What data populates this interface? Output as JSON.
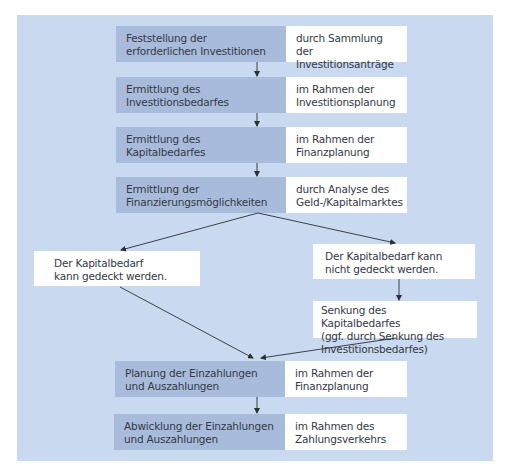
{
  "diagram": {
    "rows": [
      {
        "step": [
          "Feststellung der",
          "erforderlichen Investitionen"
        ],
        "note": [
          "durch Sammlung der",
          "Investitionsanträge"
        ]
      },
      {
        "step": [
          "Ermittlung des",
          "Investitionsbedarfes"
        ],
        "note": [
          "im Rahmen der",
          "Investitionsplanung"
        ]
      },
      {
        "step": [
          "Ermittlung des",
          "Kapitalbedarfes"
        ],
        "note": [
          "im Rahmen der",
          "Finanzplanung"
        ]
      },
      {
        "step": [
          "Ermittlung der",
          "Finanzierungsmöglichkeiten"
        ],
        "note": [
          "durch Analyse des",
          "Geld-/Kapitalmarktes"
        ]
      },
      {
        "step": [
          "Planung der Einzahlungen",
          "und Auszahlungen"
        ],
        "note": [
          "im Rahmen der",
          "Finanzplanung"
        ]
      },
      {
        "step": [
          "Abwicklung der Einzahlungen",
          "und Auszahlungen"
        ],
        "note": [
          "im Rahmen des",
          "Zahlungsverkehrs"
        ]
      }
    ],
    "branch_left": [
      "Der Kapitalbedarf",
      "kann gedeckt werden."
    ],
    "branch_right": [
      "Der Kapitalbedarf kann",
      "nicht gedeckt werden."
    ],
    "branch_right_action": [
      "Senkung des Kapitalbedarfes",
      "(ggf. durch Senkung des",
      "Investitionsbedarfes)"
    ],
    "colors": {
      "background": "#c9d9ef",
      "step_box": "#a8bbdb",
      "note_box": "#ffffff",
      "arrow": "#2b2f36"
    }
  }
}
